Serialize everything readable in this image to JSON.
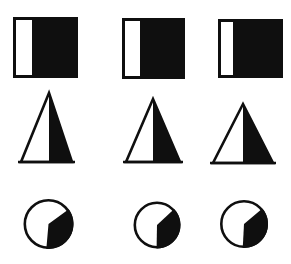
{
  "figure": {
    "canvas": {
      "width": 291,
      "height": 264
    },
    "background_color": "#ffffff",
    "ink_color": "#0f0f0f",
    "rows": [
      {
        "type": "square",
        "shading": "white vertical strip at left, rest black",
        "items": [
          {
            "x": 13,
            "y": 17,
            "width": 65,
            "height": 61,
            "white_strip_width": 19
          },
          {
            "x": 122,
            "y": 18,
            "width": 63,
            "height": 61,
            "white_strip_width": 18
          },
          {
            "x": 218,
            "y": 19,
            "width": 65,
            "height": 59,
            "white_strip_width": 15
          }
        ]
      },
      {
        "type": "triangle",
        "shading": "right half black, divided vertically from apex",
        "items": [
          {
            "apex_x": 49,
            "apex_y": 93,
            "base_y": 162,
            "base_left": 21,
            "base_right": 72
          },
          {
            "apex_x": 153,
            "apex_y": 99,
            "base_y": 162,
            "base_left": 126,
            "base_right": 180
          },
          {
            "apex_x": 243,
            "apex_y": 104,
            "base_y": 163,
            "base_left": 213,
            "base_right": 273
          }
        ]
      },
      {
        "type": "circle",
        "shading": "black pie sector from upper-right to bottom (clockwise), vertex at center",
        "items": [
          {
            "cx": 48.5,
            "cy": 224,
            "r": 25,
            "sector_start_deg": 54,
            "sector_end_deg": 185
          },
          {
            "cx": 157,
            "cy": 225,
            "r": 23.5,
            "sector_start_deg": 47,
            "sector_end_deg": 181
          },
          {
            "cx": 244,
            "cy": 224,
            "r": 24,
            "sector_start_deg": 50,
            "sector_end_deg": 183
          }
        ]
      }
    ]
  }
}
